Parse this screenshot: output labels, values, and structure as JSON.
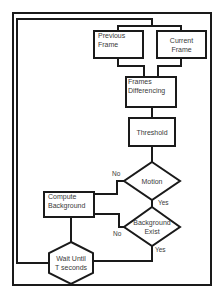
{
  "diagram": {
    "type": "flowchart",
    "nodes": {
      "previous_frame": {
        "label_line1": "Previous",
        "label_line2": "Frame",
        "shape": "rectangle"
      },
      "current_frame": {
        "label_line1": "Current",
        "label_line2": "Frame",
        "shape": "rectangle"
      },
      "frames_differencing": {
        "label_line1": "Frames",
        "label_line2": "Differencing",
        "shape": "rectangle"
      },
      "threshold": {
        "label": "Threshold",
        "shape": "rectangle"
      },
      "motion": {
        "label": "Motion",
        "shape": "diamond"
      },
      "background_exist": {
        "label_line1": "Background",
        "label_line2": "Exist",
        "shape": "diamond"
      },
      "compute_background": {
        "label_line1": "Compute",
        "label_line2": "Background",
        "shape": "rectangle"
      },
      "wait_until": {
        "label_line1": "Wait Until",
        "label_line2": "T seconds",
        "shape": "hexagon"
      }
    },
    "edges": {
      "motion_no": "No",
      "motion_yes": "Yes",
      "background_no": "No",
      "background_yes": "Yes"
    },
    "colors": {
      "stroke": "#1a1a1a",
      "text": "#3a3a3a",
      "background": "#ffffff"
    }
  }
}
